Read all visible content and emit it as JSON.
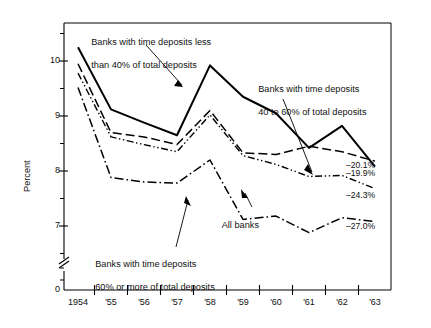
{
  "chart_data": {
    "type": "line",
    "title": "",
    "xlabel": "",
    "ylabel": "Percent",
    "ylim": [
      6.4,
      10.6
    ],
    "xlim": [
      1954,
      1963
    ],
    "grid": false,
    "legend_position": "inline-annotations",
    "x": [
      1954,
      1955,
      1956,
      1957,
      1958,
      1959,
      1960,
      1961,
      1962,
      1963
    ],
    "x_tick_labels": [
      "1954",
      "'55",
      "'56",
      "'57",
      "'58",
      "'59",
      "'60",
      "'61",
      "'62",
      "'63"
    ],
    "y_tick_labels": [
      "0",
      "7",
      "8",
      "9",
      "10"
    ],
    "y_ticks_major": [
      7,
      8,
      9,
      10
    ],
    "y_ticks_minor": [
      6.5,
      7.5,
      8.5,
      9.5,
      10.5
    ],
    "y_axis_break": true,
    "series": [
      {
        "name": "Banks with time deposits less than 40% of total deposits",
        "style": "solid",
        "values": [
          10.25,
          9.12,
          8.88,
          8.65,
          9.92,
          9.35,
          9.05,
          8.42,
          8.82,
          8.08
        ],
        "end_label": "–19.9%"
      },
      {
        "name": "Banks with time deposits 40 to 60% of total deposits",
        "style": "dashed",
        "values": [
          9.95,
          8.7,
          8.62,
          8.48,
          9.1,
          8.33,
          8.3,
          8.45,
          8.35,
          8.18
        ],
        "end_label": "–20.1%"
      },
      {
        "name": "All banks",
        "style": "dash-dot-dot",
        "values": [
          9.78,
          8.62,
          8.48,
          8.35,
          9.02,
          8.28,
          8.12,
          7.9,
          7.92,
          7.68
        ],
        "end_label": "–24.3%"
      },
      {
        "name": "Banks with time deposits 60% or more of total deposits",
        "style": "dash-dot",
        "values": [
          9.52,
          7.88,
          7.8,
          7.78,
          8.2,
          7.12,
          7.18,
          6.88,
          7.15,
          7.08
        ],
        "end_label": "–27.0%"
      }
    ],
    "annotations": [
      {
        "id": "ann-upper-left",
        "text_line1": "Banks with time deposits less",
        "text_line2": "than 40% of total deposits"
      },
      {
        "id": "ann-upper-right",
        "text_line1": "Banks with time deposits",
        "text_line2": "40 to 60% of total deposits"
      },
      {
        "id": "ann-all-banks",
        "text_line1": "All banks",
        "text_line2": ""
      },
      {
        "id": "ann-lower-left",
        "text_line1": "Banks with time deposits",
        "text_line2": "60% or more of total deposits"
      }
    ]
  },
  "colors": {
    "line": "#000000",
    "axis": "#000000",
    "text": "#111111",
    "background": "#ffffff"
  }
}
